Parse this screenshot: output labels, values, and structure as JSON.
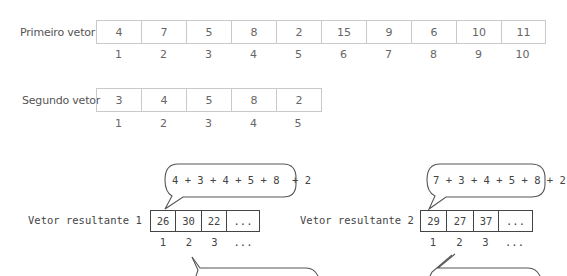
{
  "first_vector": {
    "label": "Primeiro vetor",
    "values": [
      "4",
      "7",
      "5",
      "8",
      "2",
      "15",
      "9",
      "6",
      "10",
      "11"
    ],
    "indices": [
      "1",
      "2",
      "3",
      "4",
      "5",
      "6",
      "7",
      "8",
      "9",
      "10"
    ]
  },
  "second_vector": {
    "label": "Segundo vetor",
    "values": [
      "3",
      "4",
      "5",
      "8",
      "2"
    ],
    "indices": [
      "1",
      "2",
      "3",
      "4",
      "5"
    ]
  },
  "result_vector_1": {
    "label": "Vetor resultante 1",
    "values": [
      "26",
      "30",
      "22",
      "..."
    ],
    "indices": [
      "1",
      "2",
      "3",
      "..."
    ],
    "bubble": "4 + 3 + 4 + 5 + 8  + 2"
  },
  "result_vector_2": {
    "label": "Vetor resultante 2",
    "values": [
      "29",
      "27",
      "37",
      "..."
    ],
    "indices": [
      "1",
      "2",
      "3",
      "..."
    ],
    "bubble": "7 + 3 + 4 + 5 + 8 + 2"
  },
  "colors": {
    "top_border": "#c9c9c9",
    "top_text": "#666666",
    "result_border": "#444444",
    "result_text": "#444444"
  }
}
